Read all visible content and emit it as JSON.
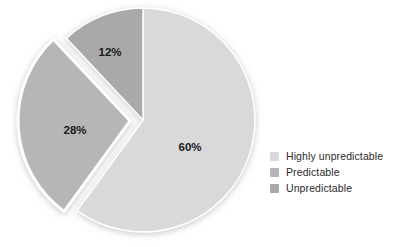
{
  "chart_data": {
    "type": "pie",
    "title": "",
    "categories": [
      "Highly unpredictable",
      "Predictable",
      "Unpredictable"
    ],
    "values": [
      60,
      28,
      12
    ],
    "data_labels": [
      "60%",
      "28%",
      "12%"
    ],
    "colors": [
      "#d9d9d9",
      "#b6b6b6",
      "#a9a9a9"
    ],
    "start_angle_deg": 0,
    "direction": "clockwise",
    "exploded_slices": [
      "Predictable"
    ],
    "legend_position": "right",
    "grid": false,
    "xlabel": "",
    "ylabel": ""
  },
  "slices": [
    {
      "label": "60%",
      "name": "Highly unpredictable",
      "value": 60,
      "color": "#d9d9d9"
    },
    {
      "label": "28%",
      "name": "Predictable",
      "value": 28,
      "color": "#b6b6b6"
    },
    {
      "label": "12%",
      "name": "Unpredictable",
      "value": 12,
      "color": "#a9a9a9"
    }
  ],
  "legend": {
    "items": [
      {
        "label": "Highly unpredictable",
        "color": "#d9d9d9"
      },
      {
        "label": "Predictable",
        "color": "#b6b6b6"
      },
      {
        "label": "Unpredictable",
        "color": "#a9a9a9"
      }
    ]
  }
}
